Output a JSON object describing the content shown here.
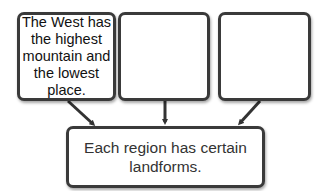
{
  "diagram": {
    "type": "converging-flow",
    "detail_boxes": [
      {
        "id": "detail-1",
        "text": "The West has the highest mountain and the lowest place."
      },
      {
        "id": "detail-2",
        "text": ""
      },
      {
        "id": "detail-3",
        "text": ""
      }
    ],
    "main_idea": {
      "text": "Each region has certain landforms."
    },
    "arrows": [
      {
        "from": "detail-1",
        "to": "main-idea"
      },
      {
        "from": "detail-2",
        "to": "main-idea"
      },
      {
        "from": "detail-3",
        "to": "main-idea"
      }
    ],
    "colors": {
      "border": "#3a3a3a",
      "background": "#ffffff",
      "text": "#111111"
    }
  }
}
